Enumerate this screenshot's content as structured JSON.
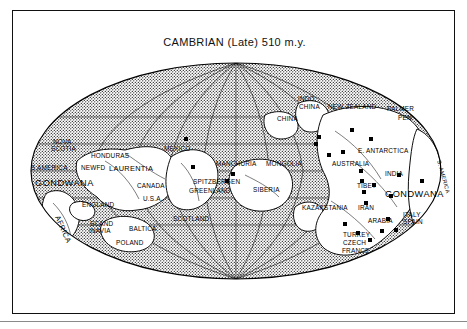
{
  "figure": {
    "title": "CAMBRIAN (Late) 510 m.y.",
    "projection": "mollweide-oval",
    "colors": {
      "ink": "#000000",
      "frame": "#111111",
      "ocean_stipple": "#000000",
      "paper": "#ffffff"
    }
  },
  "map": {
    "oval": {
      "cx": 223,
      "cy": 160,
      "rx": 205,
      "ry": 108
    },
    "continent_labels": [
      {
        "text": "GONDWANA",
        "x": 22,
        "y": 175,
        "size": "big"
      },
      {
        "text": "GONDWANA",
        "x": 372,
        "y": 186,
        "size": "big"
      },
      {
        "text": "LAURENTIA",
        "x": 96,
        "y": 160,
        "size": "mid"
      },
      {
        "text": "AFRICA",
        "x": 42,
        "y": 206,
        "size": "mid",
        "rot": 66
      },
      {
        "text": "S. AMERICA",
        "x": 424,
        "y": 150,
        "size": "sm",
        "rot": 74
      }
    ],
    "region_labels": [
      {
        "text": "NOVA",
        "x": 40,
        "y": 133
      },
      {
        "text": "SCOTIA",
        "x": 38,
        "y": 140
      },
      {
        "text": "HONDURAS",
        "x": 78,
        "y": 147
      },
      {
        "text": "MEXICO",
        "x": 151,
        "y": 140
      },
      {
        "text": "S AMERICA",
        "x": 18,
        "y": 159
      },
      {
        "text": "NEWFD",
        "x": 68,
        "y": 159
      },
      {
        "text": "CANADA",
        "x": 124,
        "y": 177
      },
      {
        "text": "U.S.A.",
        "x": 130,
        "y": 190
      },
      {
        "text": "ENGLAND",
        "x": 69,
        "y": 196
      },
      {
        "text": "SCAND",
        "x": 77,
        "y": 215
      },
      {
        "text": "INAVIA",
        "x": 76,
        "y": 222
      },
      {
        "text": "BALTICA",
        "x": 116,
        "y": 220
      },
      {
        "text": "POLAND",
        "x": 103,
        "y": 234
      },
      {
        "text": "SCOTLAND",
        "x": 160,
        "y": 210
      },
      {
        "text": "SPITZBERGEN",
        "x": 180,
        "y": 173
      },
      {
        "text": "GREENLAND",
        "x": 176,
        "y": 182
      },
      {
        "text": "MANCHURIA",
        "x": 203,
        "y": 155
      },
      {
        "text": "MONGOLIA",
        "x": 253,
        "y": 155
      },
      {
        "text": "SIBERIA",
        "x": 240,
        "y": 181
      },
      {
        "text": "KAZAKSTANIA",
        "x": 289,
        "y": 199
      },
      {
        "text": "CHINA",
        "x": 264,
        "y": 110
      },
      {
        "text": "INDO",
        "x": 285,
        "y": 90
      },
      {
        "text": "CHINA",
        "x": 286,
        "y": 98
      },
      {
        "text": "NEW ZEALAND",
        "x": 315,
        "y": 98
      },
      {
        "text": "PALMER",
        "x": 374,
        "y": 100
      },
      {
        "text": "PEN.",
        "x": 385,
        "y": 109
      },
      {
        "text": "E. ANTARCTICA",
        "x": 345,
        "y": 142
      },
      {
        "text": "AUSTRALIA",
        "x": 319,
        "y": 155
      },
      {
        "text": "INDIA",
        "x": 372,
        "y": 165
      },
      {
        "text": "TIBET",
        "x": 344,
        "y": 177
      },
      {
        "text": "IRAN",
        "x": 345,
        "y": 199
      },
      {
        "text": "ARABIA",
        "x": 355,
        "y": 212
      },
      {
        "text": "ITALY",
        "x": 390,
        "y": 206
      },
      {
        "text": "SPAIN",
        "x": 390,
        "y": 213
      },
      {
        "text": "TURKEY",
        "x": 330,
        "y": 226
      },
      {
        "text": "CZECH",
        "x": 330,
        "y": 234
      },
      {
        "text": "FRANCE",
        "x": 329,
        "y": 242
      }
    ],
    "markers": [
      {
        "x": 173,
        "y": 128
      },
      {
        "x": 180,
        "y": 156
      },
      {
        "x": 214,
        "y": 170
      },
      {
        "x": 220,
        "y": 163
      },
      {
        "x": 303,
        "y": 133
      },
      {
        "x": 306,
        "y": 126
      },
      {
        "x": 316,
        "y": 144
      },
      {
        "x": 330,
        "y": 141
      },
      {
        "x": 339,
        "y": 119
      },
      {
        "x": 358,
        "y": 128
      },
      {
        "x": 361,
        "y": 174
      },
      {
        "x": 378,
        "y": 185
      },
      {
        "x": 386,
        "y": 164
      },
      {
        "x": 375,
        "y": 208
      },
      {
        "x": 353,
        "y": 192
      },
      {
        "x": 351,
        "y": 181
      },
      {
        "x": 349,
        "y": 170
      },
      {
        "x": 348,
        "y": 160
      },
      {
        "x": 409,
        "y": 170
      },
      {
        "x": 332,
        "y": 213
      },
      {
        "x": 345,
        "y": 222
      },
      {
        "x": 357,
        "y": 229
      },
      {
        "x": 369,
        "y": 220
      },
      {
        "x": 383,
        "y": 219
      }
    ]
  }
}
